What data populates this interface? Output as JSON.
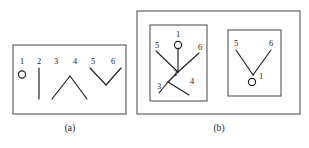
{
  "figure": {
    "background_color": "#ffffff",
    "box_stroke_color": "#555555",
    "line_stroke_color": "#1f1f1f",
    "text_color": "#1a1a1a",
    "panels": [
      {
        "id": "panel-a",
        "caption": "(a)",
        "caption_x": 70,
        "caption_y": 131,
        "box": {
          "x": 13,
          "y": 45,
          "width": 113,
          "height": 69
        },
        "labels": [
          {
            "text": "1",
            "x": 22,
            "y": 64
          },
          {
            "text": "2",
            "x": 39,
            "y": 64
          },
          {
            "text": "3",
            "x": 56,
            "y": 64
          },
          {
            "text": "4",
            "x": 75,
            "y": 64
          },
          {
            "text": "5",
            "x": 93,
            "y": 64
          },
          {
            "text": "6",
            "x": 113,
            "y": 64
          }
        ],
        "circles": [
          {
            "cx": 22,
            "cy": 74.5,
            "r": 3.6
          }
        ],
        "segments": [
          {
            "x1": 39,
            "y1": 68,
            "x2": 39,
            "y2": 99
          },
          {
            "x1": 52,
            "y1": 99,
            "x2": 70,
            "y2": 76
          },
          {
            "x1": 70,
            "y1": 76,
            "x2": 87,
            "y2": 99
          },
          {
            "x1": 90,
            "y1": 68,
            "x2": 106,
            "y2": 85
          },
          {
            "x1": 106,
            "y1": 85,
            "x2": 121,
            "y2": 68
          }
        ]
      },
      {
        "id": "panel-b",
        "caption": "(b)",
        "caption_x": 219,
        "caption_y": 131,
        "box": {
          "x": 137,
          "y": 11,
          "width": 163,
          "height": 103
        },
        "subpanels": [
          {
            "id": "subpanel-b-left",
            "box": {
              "x": 150,
              "y": 25,
              "width": 57,
              "height": 76
            },
            "labels": [
              {
                "text": "1",
                "x": 178,
                "y": 37
              },
              {
                "text": "5",
                "x": 157,
                "y": 48
              },
              {
                "text": "6",
                "x": 200,
                "y": 50
              },
              {
                "text": "2",
                "x": 175,
                "y": 76
              },
              {
                "text": "3",
                "x": 159,
                "y": 89
              },
              {
                "text": "4",
                "x": 192,
                "y": 84
              }
            ],
            "circles": [
              {
                "cx": 178,
                "cy": 45,
                "r": 3.6
              }
            ],
            "segments": [
              {
                "x1": 178,
                "y1": 49,
                "x2": 178,
                "y2": 72
              },
              {
                "x1": 156,
                "y1": 51,
                "x2": 178,
                "y2": 72
              },
              {
                "x1": 199,
                "y1": 53,
                "x2": 178,
                "y2": 72
              },
              {
                "x1": 178,
                "y1": 72,
                "x2": 168,
                "y2": 82
              },
              {
                "x1": 168,
                "y1": 82,
                "x2": 159,
                "y2": 93
              },
              {
                "x1": 168,
                "y1": 82,
                "x2": 189,
                "y2": 95
              }
            ]
          },
          {
            "id": "subpanel-b-right",
            "box": {
              "x": 228,
              "y": 30,
              "width": 53,
              "height": 66
            },
            "labels": [
              {
                "text": "5",
                "x": 236,
                "y": 46
              },
              {
                "text": "6",
                "x": 271,
                "y": 46
              },
              {
                "text": "1",
                "x": 261,
                "y": 79
              }
            ],
            "circles": [
              {
                "cx": 252,
                "cy": 82,
                "r": 3.6
              }
            ],
            "segments": [
              {
                "x1": 236,
                "y1": 50,
                "x2": 253,
                "y2": 75
              },
              {
                "x1": 253,
                "y1": 75,
                "x2": 271,
                "y2": 50
              }
            ]
          }
        ]
      }
    ]
  }
}
